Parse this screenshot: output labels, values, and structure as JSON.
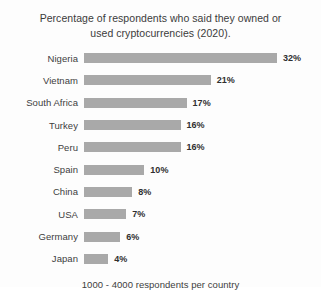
{
  "chart_data": {
    "type": "bar",
    "orientation": "horizontal",
    "title": "Percentage of respondents who said they owned or used cryptocurrencies (2020).",
    "title_lines": [
      "Percentage of respondents who said they owned or",
      "used cryptocurrencies (2020)."
    ],
    "footnote": "1000 - 4000 respondents per country",
    "xlabel": "",
    "ylabel": "",
    "xlim": [
      0,
      32
    ],
    "grid": false,
    "legend": false,
    "value_suffix": "%",
    "bar_color": "#a9a9a9",
    "label_color": "#3d3d3d",
    "value_color": "#2f2f2f",
    "categories": [
      "Nigeria",
      "Vietnam",
      "South Africa",
      "Turkey",
      "Peru",
      "Spain",
      "China",
      "USA",
      "Germany",
      "Japan"
    ],
    "values": [
      32,
      21,
      17,
      16,
      16,
      10,
      8,
      7,
      6,
      4
    ],
    "value_labels": [
      "32%",
      "21%",
      "17%",
      "16%",
      "16%",
      "10%",
      "8%",
      "7%",
      "6%",
      "4%"
    ],
    "rows": [
      {
        "category": "Nigeria",
        "value": 32,
        "label": "32%"
      },
      {
        "category": "Vietnam",
        "value": 21,
        "label": "21%"
      },
      {
        "category": "South Africa",
        "value": 17,
        "label": "17%"
      },
      {
        "category": "Turkey",
        "value": 16,
        "label": "16%"
      },
      {
        "category": "Peru",
        "value": 16,
        "label": "16%"
      },
      {
        "category": "Spain",
        "value": 10,
        "label": "10%"
      },
      {
        "category": "China",
        "value": 8,
        "label": "8%"
      },
      {
        "category": "USA",
        "value": 7,
        "label": "7%"
      },
      {
        "category": "Germany",
        "value": 6,
        "label": "6%"
      },
      {
        "category": "Japan",
        "value": 4,
        "label": "4%"
      }
    ]
  }
}
